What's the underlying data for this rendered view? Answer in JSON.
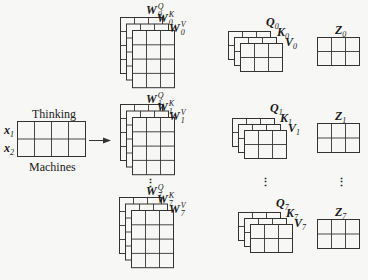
{
  "input": {
    "top_label": "Thinking",
    "bottom_label": "Machines",
    "rows": [
      {
        "name": "x",
        "sub": "1"
      },
      {
        "name": "x",
        "sub": "2"
      }
    ],
    "cols": 4
  },
  "heads": [
    {
      "index": "0",
      "weights": {
        "q": {
          "name": "W",
          "sub": "0",
          "sup": "Q"
        },
        "k": {
          "name": "W",
          "sub": "0",
          "sup": "K"
        },
        "v": {
          "name": "W",
          "sub": "0",
          "sup": "V"
        }
      },
      "qkv": {
        "q": {
          "name": "Q",
          "sub": "0"
        },
        "k": {
          "name": "K",
          "sub": "0"
        },
        "v": {
          "name": "V",
          "sub": "0"
        }
      },
      "z": {
        "name": "Z",
        "sub": "0"
      }
    },
    {
      "index": "1",
      "weights": {
        "q": {
          "name": "W",
          "sub": "1",
          "sup": "Q"
        },
        "k": {
          "name": "W",
          "sub": "1",
          "sup": "K"
        },
        "v": {
          "name": "W",
          "sub": "1",
          "sup": "V"
        }
      },
      "qkv": {
        "q": {
          "name": "Q",
          "sub": "1"
        },
        "k": {
          "name": "K",
          "sub": "1"
        },
        "v": {
          "name": "V",
          "sub": "1"
        }
      },
      "z": {
        "name": "Z",
        "sub": "1"
      }
    },
    {
      "index": "7",
      "weights": {
        "q": {
          "name": "W",
          "sub": "7",
          "sup": "Q"
        },
        "k": {
          "name": "W",
          "sub": "7",
          "sup": "K"
        },
        "v": {
          "name": "W",
          "sub": "7",
          "sup": "V"
        }
      },
      "qkv": {
        "q": {
          "name": "Q",
          "sub": "7"
        },
        "k": {
          "name": "K",
          "sub": "7"
        },
        "v": {
          "name": "V",
          "sub": "7"
        }
      },
      "z": {
        "name": "Z",
        "sub": "7"
      }
    }
  ],
  "ellipsis": "⋮",
  "colors": {
    "line": "#333333",
    "fill": "#f7f7f5",
    "background": "#f7f7f5"
  }
}
